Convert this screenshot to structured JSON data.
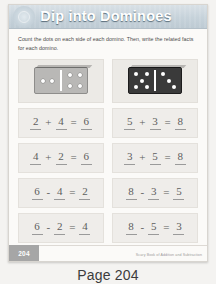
{
  "worksheet": {
    "title": "Dip into Dominoes",
    "instructions": "Count the dots on each side of each domino. Then, write the related facts for each domino.",
    "page_number": "204",
    "credit": "Scary Book of Addition and Subtraction",
    "columns": [
      {
        "domino": {
          "name": "domino-2-4",
          "style": "light",
          "left_pips": 2,
          "right_pips": 4
        },
        "equations": [
          {
            "a": "2",
            "op": "+",
            "b": "4",
            "eq": "=",
            "result": "6"
          },
          {
            "a": "4",
            "op": "+",
            "b": "2",
            "eq": "=",
            "result": "6"
          },
          {
            "a": "6",
            "op": "-",
            "b": "4",
            "eq": "=",
            "result": "2"
          },
          {
            "a": "6",
            "op": "-",
            "b": "2",
            "eq": "=",
            "result": "4"
          }
        ]
      },
      {
        "domino": {
          "name": "domino-5-3",
          "style": "dark",
          "left_pips": 5,
          "right_pips": 3
        },
        "equations": [
          {
            "a": "5",
            "op": "+",
            "b": "3",
            "eq": "=",
            "result": "8"
          },
          {
            "a": "3",
            "op": "+",
            "b": "5",
            "eq": "=",
            "result": "8"
          },
          {
            "a": "8",
            "op": "-",
            "b": "3",
            "eq": "=",
            "result": "5"
          },
          {
            "a": "8",
            "op": "-",
            "b": "5",
            "eq": "=",
            "result": "3"
          }
        ]
      }
    ]
  },
  "caption": "Page 204",
  "colors": {
    "header_band": "#c6d2da",
    "title_text": "#ffffff",
    "panel_bg": "#efedea",
    "domino_light": "#b9b8b6",
    "domino_dark": "#3a3a3a",
    "page_tab": "#a6a6a6"
  }
}
